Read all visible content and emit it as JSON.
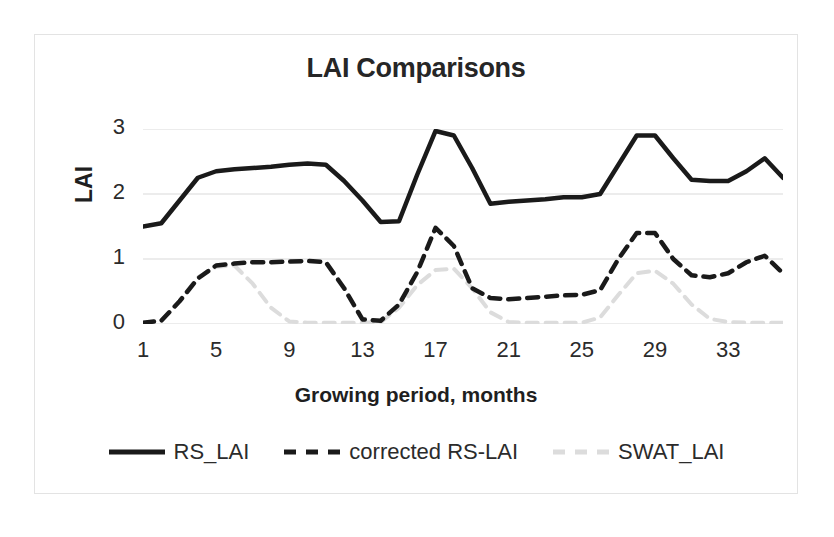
{
  "chart_data": {
    "type": "line",
    "title": "LAI Comparisons",
    "xlabel": "Growing period, months",
    "ylabel": "LAI",
    "xlim": [
      1,
      36
    ],
    "ylim": [
      0,
      3
    ],
    "grid": true,
    "legend_position": "bottom",
    "xticks": [
      "1",
      "5",
      "9",
      "13",
      "17",
      "21",
      "25",
      "29",
      "33"
    ],
    "xtick_values": [
      1,
      5,
      9,
      13,
      17,
      21,
      25,
      29,
      33
    ],
    "yticks": [
      "0",
      "1",
      "2",
      "3"
    ],
    "ytick_values": [
      0,
      1,
      2,
      3
    ],
    "x": [
      1,
      2,
      3,
      4,
      5,
      6,
      7,
      8,
      9,
      10,
      11,
      12,
      13,
      14,
      15,
      16,
      17,
      18,
      19,
      20,
      21,
      22,
      23,
      24,
      25,
      26,
      27,
      28,
      29,
      30,
      31,
      32,
      33,
      34,
      35,
      36
    ],
    "series": [
      {
        "name": "RS_LAI",
        "color": "#1a1a1a",
        "style": "solid",
        "width": 4.5,
        "values": [
          1.5,
          1.55,
          1.9,
          2.25,
          2.35,
          2.38,
          2.4,
          2.42,
          2.45,
          2.47,
          2.45,
          2.2,
          1.9,
          1.57,
          1.58,
          2.3,
          2.97,
          2.9,
          2.4,
          1.85,
          1.88,
          1.9,
          1.92,
          1.95,
          1.95,
          2.0,
          2.45,
          2.9,
          2.9,
          2.55,
          2.22,
          2.2,
          2.2,
          2.35,
          2.55,
          2.25
        ]
      },
      {
        "name": "corrected RS-LAI",
        "color": "#1a1a1a",
        "style": "dashed",
        "width": 4.5,
        "values": [
          0.02,
          0.05,
          0.35,
          0.7,
          0.9,
          0.93,
          0.95,
          0.95,
          0.96,
          0.97,
          0.95,
          0.55,
          0.07,
          0.05,
          0.3,
          0.8,
          1.48,
          1.2,
          0.55,
          0.4,
          0.38,
          0.4,
          0.42,
          0.44,
          0.45,
          0.52,
          1.0,
          1.4,
          1.4,
          1.0,
          0.75,
          0.72,
          0.78,
          0.95,
          1.05,
          0.78
        ]
      },
      {
        "name": "SWAT_LAI",
        "color": "#dcdcdc",
        "style": "dashed",
        "width": 4.0,
        "values": [
          0.02,
          0.05,
          0.35,
          0.72,
          0.88,
          0.9,
          0.62,
          0.25,
          0.04,
          0.02,
          0.02,
          0.02,
          0.02,
          0.03,
          0.25,
          0.6,
          0.83,
          0.85,
          0.55,
          0.18,
          0.03,
          0.02,
          0.02,
          0.02,
          0.02,
          0.1,
          0.45,
          0.78,
          0.82,
          0.62,
          0.3,
          0.08,
          0.03,
          0.02,
          0.02,
          0.02
        ]
      }
    ]
  },
  "legend": {
    "items": [
      {
        "label": "RS_LAI",
        "color": "#1a1a1a",
        "style": "solid"
      },
      {
        "label": "corrected RS-LAI",
        "color": "#1a1a1a",
        "style": "dashed"
      },
      {
        "label": "SWAT_LAI",
        "color": "#dcdcdc",
        "style": "dashed"
      }
    ]
  }
}
